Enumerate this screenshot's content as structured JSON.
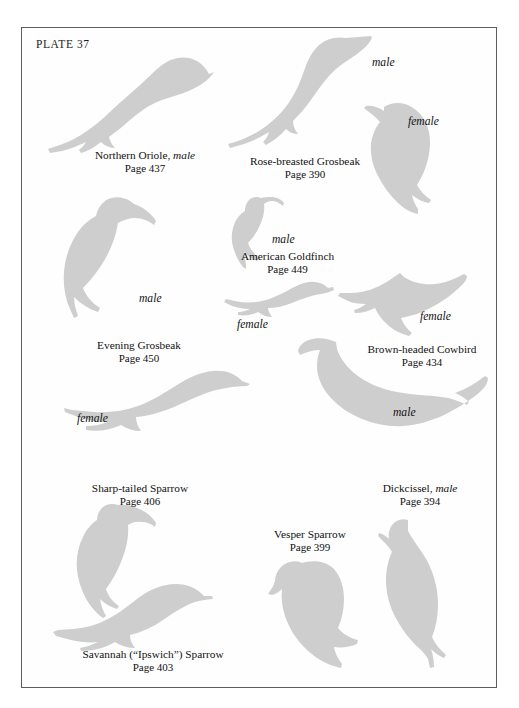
{
  "plate": {
    "title": "PLATE 37",
    "background_color": "#ffffff",
    "frame_color": "#5d5d5d",
    "silhouette_color": "#cdcecd",
    "text_color": "#111111"
  },
  "captions": [
    {
      "id": "northern-oriole",
      "name": "Northern Oriole, ",
      "name_italic": "male",
      "page": "Page 437"
    },
    {
      "id": "rose-breasted-grosbeak",
      "name": "Rose-breasted Grosbeak",
      "name_italic": "",
      "page": "Page 390"
    },
    {
      "id": "american-goldfinch",
      "name": "American Goldfinch",
      "name_italic": "",
      "page": "Page 449"
    },
    {
      "id": "evening-grosbeak",
      "name": "Evening Grosbeak",
      "name_italic": "",
      "page": "Page 450"
    },
    {
      "id": "brown-headed-cowbird",
      "name": "Brown-headed Cowbird",
      "name_italic": "",
      "page": "Page 434"
    },
    {
      "id": "sharp-tailed-sparrow",
      "name": "Sharp-tailed Sparrow",
      "name_italic": "",
      "page": "Page 406"
    },
    {
      "id": "dickcissel",
      "name": "Dickcissel, ",
      "name_italic": "male",
      "page": "Page 394"
    },
    {
      "id": "vesper-sparrow",
      "name": "Vesper Sparrow",
      "name_italic": "",
      "page": "Page 399"
    },
    {
      "id": "savannah-sparrow",
      "name": "Savannah (“Ipswich”) Sparrow",
      "name_italic": "",
      "page": "Page 403"
    }
  ],
  "sex_labels": {
    "rose_grosbeak_male": "male",
    "rose_grosbeak_female": "female",
    "goldfinch_male": "male",
    "goldfinch_female": "female",
    "evening_grosbeak_male": "male",
    "evening_grosbeak_female": "female",
    "cowbird_female": "female",
    "cowbird_male": "male"
  },
  "birds": [
    {
      "id": "northern-oriole-male",
      "species": "Northern Oriole",
      "sex": "male"
    },
    {
      "id": "rose-breasted-grosbeak-male",
      "species": "Rose-breasted Grosbeak",
      "sex": "male"
    },
    {
      "id": "rose-breasted-grosbeak-female",
      "species": "Rose-breasted Grosbeak",
      "sex": "female"
    },
    {
      "id": "american-goldfinch-male",
      "species": "American Goldfinch",
      "sex": "male"
    },
    {
      "id": "american-goldfinch-female",
      "species": "American Goldfinch",
      "sex": "female"
    },
    {
      "id": "evening-grosbeak-male",
      "species": "Evening Grosbeak",
      "sex": "male"
    },
    {
      "id": "evening-grosbeak-female",
      "species": "Evening Grosbeak",
      "sex": "female"
    },
    {
      "id": "brown-headed-cowbird-female",
      "species": "Brown-headed Cowbird",
      "sex": "female"
    },
    {
      "id": "brown-headed-cowbird-male",
      "species": "Brown-headed Cowbird",
      "sex": "male"
    },
    {
      "id": "sharp-tailed-sparrow",
      "species": "Sharp-tailed Sparrow",
      "sex": ""
    },
    {
      "id": "savannah-sparrow",
      "species": "Savannah Sparrow",
      "sex": ""
    },
    {
      "id": "vesper-sparrow",
      "species": "Vesper Sparrow",
      "sex": ""
    },
    {
      "id": "dickcissel-male",
      "species": "Dickcissel",
      "sex": "male"
    }
  ]
}
